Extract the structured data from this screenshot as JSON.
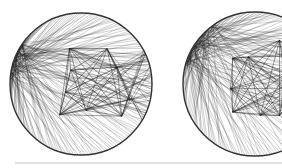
{
  "image": {
    "description": "Two circular string-art network diagrams with dense chord lines",
    "colors": {
      "background": "#ffffff",
      "ink": "#1a1a1a",
      "rim": "#333333",
      "rule": "#e2e2e2"
    },
    "figures": [
      {
        "name": "left-circle",
        "cx": 81,
        "cy": 84,
        "r": 71,
        "hub_angle": 200,
        "spread": 0.55,
        "seed": 3
      },
      {
        "name": "right-circle",
        "cx": 255,
        "cy": 84,
        "r": 72,
        "hub_angle": 215,
        "spread": 0.75,
        "seed": 7
      }
    ]
  }
}
